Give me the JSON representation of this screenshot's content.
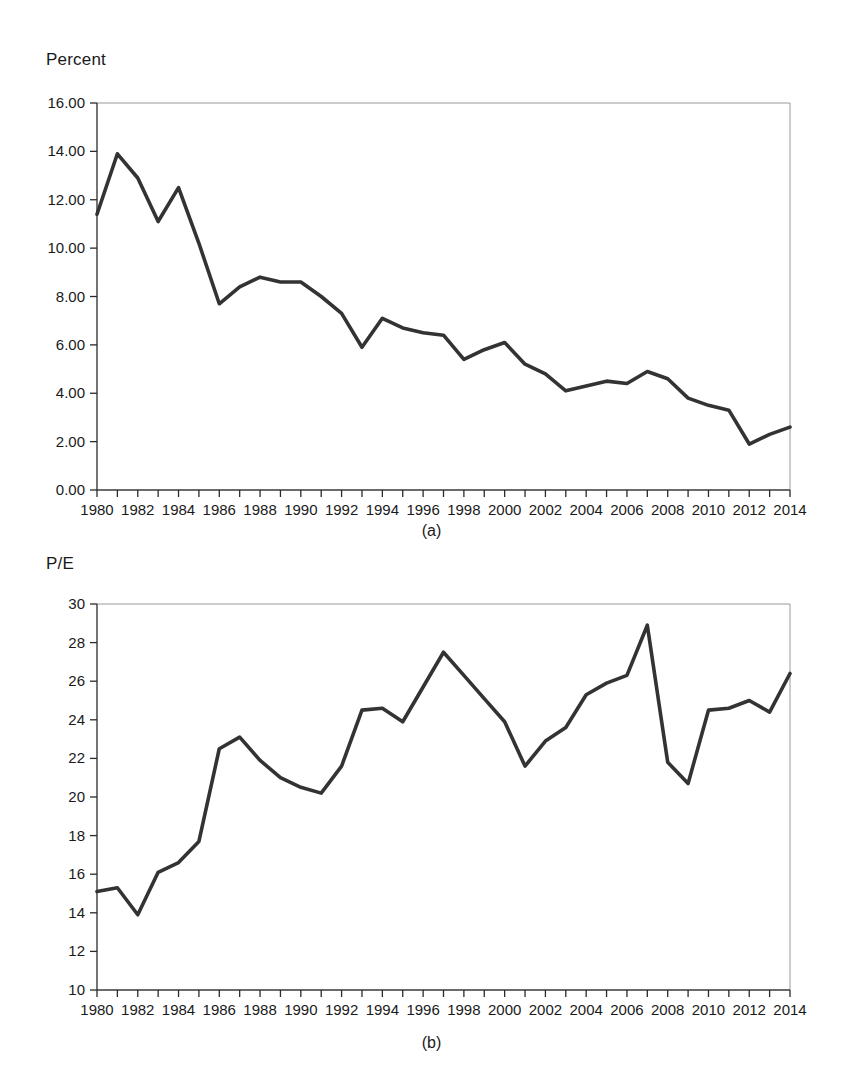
{
  "page": {
    "background": "#ffffff",
    "line_color": "#333333",
    "axis_color": "#2a2a2a",
    "frame_color": "#9a9a9a"
  },
  "panels": [
    {
      "id": "a",
      "caption": "(a)",
      "axis_title": "Percent"
    },
    {
      "id": "b",
      "caption": "(b)",
      "axis_title": "P/E"
    }
  ],
  "chart_data": [
    {
      "type": "line",
      "title": "",
      "subtitle": "(a)",
      "xlabel": "",
      "ylabel": "Percent",
      "xlim": [
        1980,
        2014
      ],
      "ylim": [
        0.0,
        16.0
      ],
      "yticks": [
        0.0,
        2.0,
        4.0,
        6.0,
        8.0,
        10.0,
        12.0,
        14.0,
        16.0
      ],
      "ytick_labels": [
        "0.00",
        "2.00",
        "4.00",
        "6.00",
        "8.00",
        "10.00",
        "12.00",
        "14.00",
        "16.00"
      ],
      "xticks": [
        1980,
        1981,
        1982,
        1983,
        1984,
        1985,
        1986,
        1987,
        1988,
        1989,
        1990,
        1991,
        1992,
        1993,
        1994,
        1995,
        1996,
        1997,
        1998,
        1999,
        2000,
        2001,
        2002,
        2003,
        2004,
        2005,
        2006,
        2007,
        2008,
        2009,
        2010,
        2011,
        2012,
        2013,
        2014
      ],
      "xtick_labels": [
        "1980",
        "",
        "1982",
        "",
        "1984",
        "",
        "1986",
        "",
        "1988",
        "",
        "1990",
        "",
        "1992",
        "",
        "1994",
        "",
        "1996",
        "",
        "1998",
        "",
        "2000",
        "",
        "2002",
        "",
        "2004",
        "",
        "2006",
        "",
        "2008",
        "",
        "2010",
        "",
        "2012",
        "",
        "2014"
      ],
      "grid": false,
      "legend": null,
      "x": [
        1980,
        1981,
        1982,
        1983,
        1984,
        1985,
        1986,
        1987,
        1988,
        1989,
        1990,
        1991,
        1992,
        1993,
        1994,
        1995,
        1996,
        1997,
        1998,
        1999,
        2000,
        2001,
        2002,
        2003,
        2004,
        2005,
        2006,
        2007,
        2008,
        2009,
        2010,
        2011,
        2012,
        2013,
        2014
      ],
      "values": [
        11.4,
        13.9,
        12.9,
        11.1,
        12.5,
        10.2,
        7.7,
        8.4,
        8.8,
        8.6,
        8.6,
        8.0,
        7.3,
        5.9,
        7.1,
        6.7,
        6.5,
        6.4,
        5.4,
        5.8,
        6.1,
        5.2,
        4.8,
        4.1,
        4.3,
        4.5,
        4.4,
        4.9,
        4.6,
        3.8,
        3.5,
        3.3,
        1.9,
        2.3,
        2.6
      ]
    },
    {
      "type": "line",
      "title": "",
      "subtitle": "(b)",
      "xlabel": "",
      "ylabel": "P/E",
      "xlim": [
        1980,
        2014
      ],
      "ylim": [
        10,
        30
      ],
      "yticks": [
        10,
        12,
        14,
        16,
        18,
        20,
        22,
        24,
        26,
        28,
        30
      ],
      "ytick_labels": [
        "10",
        "12",
        "14",
        "16",
        "18",
        "20",
        "22",
        "24",
        "26",
        "28",
        "30"
      ],
      "xticks": [
        1980,
        1981,
        1982,
        1983,
        1984,
        1985,
        1986,
        1987,
        1988,
        1989,
        1990,
        1991,
        1992,
        1993,
        1994,
        1995,
        1996,
        1997,
        1998,
        1999,
        2000,
        2001,
        2002,
        2003,
        2004,
        2005,
        2006,
        2007,
        2008,
        2009,
        2010,
        2011,
        2012,
        2013,
        2014
      ],
      "xtick_labels": [
        "1980",
        "",
        "1982",
        "",
        "1984",
        "",
        "1986",
        "",
        "1988",
        "",
        "1990",
        "",
        "1992",
        "",
        "1994",
        "",
        "1996",
        "",
        "1998",
        "",
        "2000",
        "",
        "2002",
        "",
        "2004",
        "",
        "2006",
        "",
        "2008",
        "",
        "2010",
        "",
        "2012",
        "",
        "2014"
      ],
      "grid": false,
      "legend": null,
      "x": [
        1980,
        1981,
        1982,
        1983,
        1984,
        1985,
        1986,
        1987,
        1988,
        1989,
        1990,
        1991,
        1992,
        1993,
        1994,
        1995,
        1996,
        1997,
        1998,
        1999,
        2000,
        2001,
        2002,
        2003,
        2004,
        2005,
        2006,
        2007,
        2008,
        2009,
        2010,
        2011,
        2012,
        2013,
        2014
      ],
      "values": [
        15.1,
        15.3,
        13.9,
        16.1,
        16.6,
        17.7,
        22.5,
        23.1,
        21.9,
        21.0,
        20.5,
        20.2,
        21.6,
        24.5,
        24.6,
        23.9,
        25.7,
        27.5,
        26.3,
        25.1,
        23.9,
        21.6,
        22.9,
        23.6,
        25.3,
        25.9,
        26.3,
        28.9,
        21.8,
        20.7,
        24.5,
        24.6,
        25.0,
        24.4,
        26.4
      ]
    }
  ]
}
